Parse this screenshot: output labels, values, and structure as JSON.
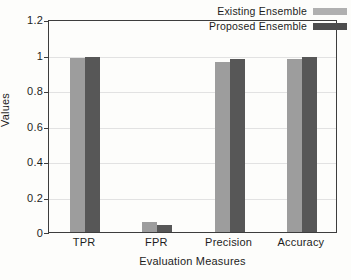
{
  "chart_data": {
    "type": "bar",
    "title": "",
    "xlabel": "Evaluation Measures",
    "ylabel": "Values",
    "categories": [
      "TPR",
      "FPR",
      "Precision",
      "Accuracy"
    ],
    "series": [
      {
        "name": "Existing Ensemble",
        "color": "#9d9d9d",
        "values": [
          0.978,
          0.055,
          0.96,
          0.976
        ]
      },
      {
        "name": "Proposed Ensemble",
        "color": "#575757",
        "values": [
          0.988,
          0.04,
          0.975,
          0.987
        ]
      }
    ],
    "ylim": [
      0,
      1.2
    ],
    "yticks": [
      0,
      0.2,
      0.4,
      0.6,
      0.8,
      1,
      1.2
    ],
    "ytick_labels": [
      "0",
      "0.2",
      "0.4",
      "0.6",
      "0.8",
      "1",
      "1.2"
    ],
    "grid": true,
    "legend_position": "top-right"
  },
  "legend": {
    "entries": [
      {
        "label": "Existing Ensemble",
        "swatch": "existing"
      },
      {
        "label": "Proposed Ensemble",
        "swatch": "proposed"
      }
    ]
  },
  "colors": {
    "existing_bar": "#9d9d9d",
    "proposed_bar": "#575757",
    "existing_swatch": "#b0b0b0",
    "proposed_swatch": "#4d4d4d",
    "axis": "#3d3d3d",
    "grid": "#e2e2e2",
    "background": "#fdfdfb"
  }
}
